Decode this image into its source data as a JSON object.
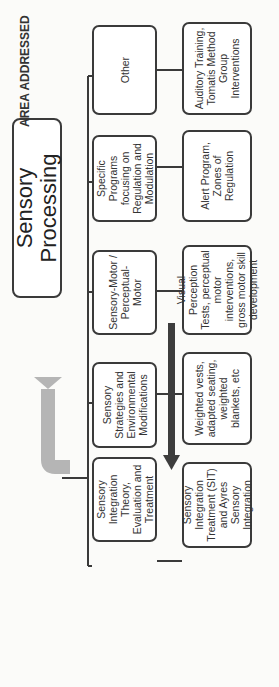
{
  "diagram": {
    "orientation": "rotated -90deg",
    "root": {
      "label": "Sensory Processing"
    },
    "row_labels": {
      "area": "AREA ADDRESSED",
      "models": "MODELS",
      "examples": "EXAMPLES"
    },
    "models": [
      {
        "label": "Sensory Integration Theory, Evaluation and Treatment"
      },
      {
        "label": "Sensory Strategies and Environmental Modifications"
      },
      {
        "label": "Sensory-Motor / Perceptual-Motor"
      },
      {
        "label": "Specific Programs focusing on Regulation and Modulation"
      },
      {
        "label": "Other"
      }
    ],
    "examples": [
      {
        "label": "Sensory Integration Treatment (SIT) and Ayres Sensory Integration"
      },
      {
        "label": "Weighted vests, adapted seating, weighted blankets, etc"
      },
      {
        "label": "Visual Perception Tests, perceptual motor interventions, gross motor skill development"
      },
      {
        "label": "Alert Program, Zones of Regulation"
      },
      {
        "label": "Auditory Training, Tomatis Method Group Interventions"
      }
    ],
    "arrows": {
      "feedback_arrow_color": "#b5b5b5",
      "direction_arrow_color": "#3d3d3d"
    },
    "colors": {
      "box_border": "#3a3a3a",
      "background": "#fbfbf9"
    }
  }
}
